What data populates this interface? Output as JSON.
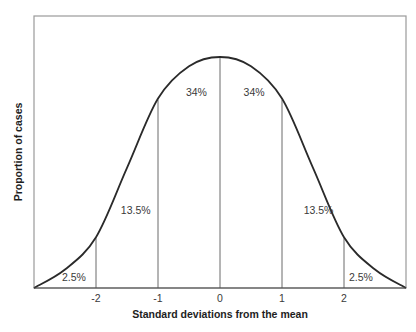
{
  "chart_data": {
    "type": "area",
    "title": "",
    "xlabel": "Standard deviations from the mean",
    "ylabel": "Proportion of cases",
    "xlim": [
      -3,
      3
    ],
    "ylim": [
      0,
      1.15
    ],
    "grid": false,
    "legend": "none",
    "x_ticks": [
      {
        "value": -2,
        "label": "-2"
      },
      {
        "value": -1,
        "label": "-1"
      },
      {
        "value": 0,
        "label": "0"
      },
      {
        "value": 1,
        "label": "1"
      },
      {
        "value": 2,
        "label": "2"
      }
    ],
    "curve": {
      "x": [
        -3,
        -2.5,
        -2,
        -1.5,
        -1,
        -0.5,
        0,
        0.5,
        1,
        1.5,
        2,
        2.5,
        3
      ],
      "y": [
        0,
        0.08,
        0.22,
        0.52,
        0.82,
        0.96,
        1.0,
        0.96,
        0.82,
        0.52,
        0.22,
        0.08,
        0
      ]
    },
    "dividers": [
      -2,
      -1,
      0,
      1,
      2
    ],
    "regions": [
      {
        "from": -3,
        "to": -2,
        "label": "2.5%",
        "value": 2.5
      },
      {
        "from": -2,
        "to": -1,
        "label": "13.5%",
        "value": 13.5
      },
      {
        "from": -1,
        "to": 0,
        "label": "34%",
        "value": 34
      },
      {
        "from": 0,
        "to": 1,
        "label": "34%",
        "value": 34
      },
      {
        "from": 1,
        "to": 2,
        "label": "13.5%",
        "value": 13.5
      },
      {
        "from": 2,
        "to": 3,
        "label": "2.5%",
        "value": 2.5
      }
    ]
  }
}
